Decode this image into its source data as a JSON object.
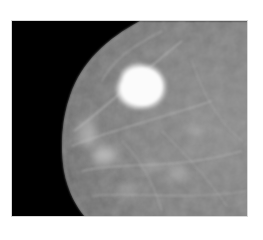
{
  "image": {
    "subject": "mammogram",
    "description": "Grayscale mammogram showing breast tissue with a bright rounded dense mass in the upper-central region",
    "colors": {
      "background": "#ffffff",
      "air": "#000000",
      "tissue": "#7a7a7a",
      "mass": "#f4f4f4"
    },
    "mass": {
      "center_x": 127,
      "center_y": 67,
      "radius_x": 24,
      "radius_y": 21
    }
  }
}
